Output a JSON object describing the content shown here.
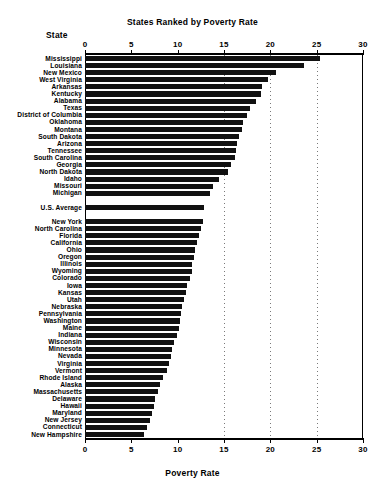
{
  "chart_data": {
    "type": "bar",
    "orientation": "horizontal",
    "title": "States Ranked by Poverty Rate",
    "xlabel": "Poverty Rate",
    "ylabel": "State",
    "xlim": [
      0,
      30
    ],
    "xticks": [
      0,
      5,
      10,
      15,
      20,
      25,
      30
    ],
    "grid": true,
    "gridlines_at": [
      15,
      20,
      25
    ],
    "legend": null,
    "categories": [
      "Mississippi",
      "Louisiana",
      "New Mexico",
      "West Virginia",
      "Arkansas",
      "Kentucky",
      "Alabama",
      "Texas",
      "District of Columbia",
      "Oklahoma",
      "Montana",
      "South Dakota",
      "Arizona",
      "Tennessee",
      "South Carolina",
      "Georgia",
      "North Dakota",
      "Idaho",
      "Missouri",
      "Michigan",
      "U.S. Average",
      "New York",
      "North Carolina",
      "Florida",
      "California",
      "Ohio",
      "Oregon",
      "Illinois",
      "Wyoming",
      "Colorado",
      "Iowa",
      "Kansas",
      "Utah",
      "Nebraska",
      "Pennsylvania",
      "Washington",
      "Maine",
      "Indiana",
      "Wisconsin",
      "Minnesota",
      "Nevada",
      "Virginia",
      "Vermont",
      "Rhode Island",
      "Alaska",
      "Massachusetts",
      "Delaware",
      "Hawaii",
      "Maryland",
      "New Jersey",
      "Connecticut",
      "New Hampshire"
    ],
    "values": [
      25.4,
      23.6,
      20.6,
      19.7,
      19.1,
      19.0,
      18.4,
      17.8,
      17.5,
      17.1,
      16.9,
      16.6,
      16.4,
      16.3,
      16.2,
      15.8,
      15.4,
      14.5,
      13.8,
      13.5,
      12.8,
      12.7,
      12.5,
      12.3,
      12.1,
      11.9,
      11.8,
      11.6,
      11.5,
      11.3,
      11.0,
      10.9,
      10.7,
      10.5,
      10.4,
      10.3,
      10.1,
      9.9,
      9.6,
      9.4,
      9.3,
      9.1,
      8.8,
      8.4,
      8.1,
      7.9,
      7.6,
      7.4,
      7.2,
      7.0,
      6.7,
      6.4
    ],
    "separator_rows": [
      "U.S. Average"
    ],
    "bar_color": "#111111"
  },
  "axis": {
    "tick_labels": [
      "0",
      "5",
      "10",
      "15",
      "20",
      "25",
      "30"
    ]
  },
  "headers": {
    "state": "State"
  }
}
